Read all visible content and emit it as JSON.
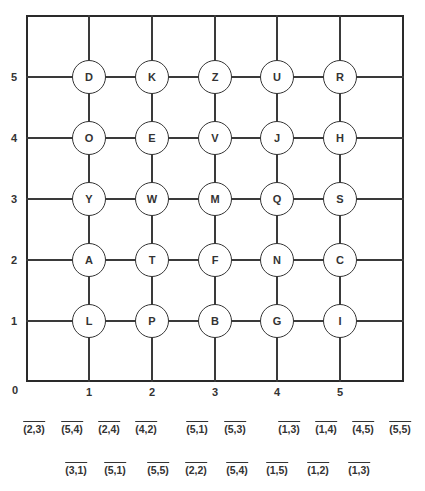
{
  "grid": {
    "x_ticks": [
      "0",
      "1",
      "2",
      "3",
      "4",
      "5"
    ],
    "y_ticks": [
      "1",
      "2",
      "3",
      "4",
      "5"
    ],
    "rows": [
      {
        "y": 5,
        "letters": [
          "D",
          "K",
          "Z",
          "U",
          "R"
        ]
      },
      {
        "y": 4,
        "letters": [
          "O",
          "E",
          "V",
          "J",
          "H"
        ]
      },
      {
        "y": 3,
        "letters": [
          "Y",
          "W",
          "M",
          "Q",
          "S"
        ]
      },
      {
        "y": 2,
        "letters": [
          "A",
          "T",
          "F",
          "N",
          "C"
        ]
      },
      {
        "y": 1,
        "letters": [
          "L",
          "P",
          "B",
          "G",
          "I"
        ]
      }
    ]
  },
  "answer_blanks": {
    "line1": [
      "(2,3)",
      "(5,4)",
      "(2,4)",
      "(4,2)",
      "(5,1)",
      "(5,3)",
      "(1,3)",
      "(1,4)",
      "(4,5)",
      "(5,5)"
    ],
    "line2": [
      "(3,1)",
      "(5,1)",
      "(5,5)",
      "(2,2)",
      "(5,4)",
      "(1,5)",
      "(1,2)",
      "(1,3)"
    ]
  }
}
